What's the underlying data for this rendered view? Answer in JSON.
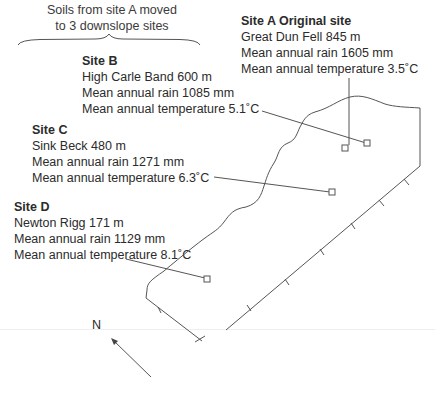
{
  "caption": {
    "line1": "Soils from site A moved",
    "line2": "to 3 downslope sites"
  },
  "sites": [
    {
      "id": "A",
      "title": "Site A Original site",
      "location": "Great Dun Fell 845 m",
      "rain": "Mean annual rain 1605 mm",
      "temperature": "Mean annual temperature 3.5˚C"
    },
    {
      "id": "B",
      "title": "Site B",
      "location": "High Carle Band 600 m",
      "rain": "Mean annual rain 1085 mm",
      "temperature": "Mean annual temperature 5.1˚C"
    },
    {
      "id": "C",
      "title": "Site C",
      "location": "Sink Beck 480 m",
      "rain": "Mean annual rain 1271 mm",
      "temperature": "Mean annual temperature 6.3˚C"
    },
    {
      "id": "D",
      "title": "Site D",
      "location": "Newton Rigg 171 m",
      "rain": "Mean annual rain 1129 mm",
      "temperature": "Mean annual temperature 8.1˚C"
    }
  ],
  "compass": {
    "label": "N"
  },
  "colors": {
    "line": "#555555",
    "text": "#2b2b2b"
  }
}
